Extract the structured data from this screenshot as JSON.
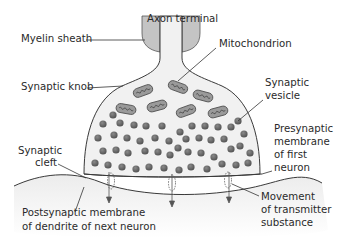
{
  "diagram": {
    "labels": {
      "axon_terminal": "Axon terminal",
      "myelin_sheath": "Myelin sheath",
      "mitochondrion": "Mitochondrion",
      "synaptic_knob": "Synaptic knob",
      "synaptic_vesicle_1": "Synaptic",
      "synaptic_vesicle_2": "vesicle",
      "synaptic_cleft_1": "Synaptic",
      "synaptic_cleft_2": "cleft",
      "presynaptic_1": "Presynaptic",
      "presynaptic_2": "membrane",
      "presynaptic_3": "of first",
      "presynaptic_4": "neuron",
      "postsynaptic_1": "Postsynaptic membrane",
      "postsynaptic_2": "of dendrite of next neuron",
      "movement_1": "Movement",
      "movement_2": "of transmitter",
      "movement_3": "substance"
    },
    "colors": {
      "myelin": "#c4c4c4",
      "knob_fill": "#f1f1f1",
      "vesicle": "#6a6a6a",
      "mitochondrion": "#9a9a9a",
      "dendrite_fill": "#f3f3f3",
      "outline": "#3a3a3a"
    }
  }
}
